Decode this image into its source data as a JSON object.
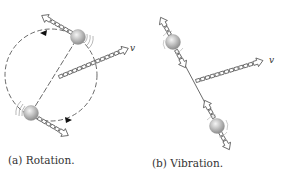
{
  "figures": [
    {
      "id": "a",
      "caption": "(a)  Rotation.",
      "velocity_label": "v",
      "description": "Two-ball molecule rotating about its center along a dashed circular path"
    },
    {
      "id": "b",
      "caption": "(b)  Vibration.",
      "velocity_label": "v",
      "description": "Two-ball molecule vibrating along its axis"
    }
  ],
  "colors": {
    "ball_fill": "#b8b8b8",
    "ball_highlight": "#f2f2f2",
    "line": "#444444",
    "arrow_fill": "#ffffff",
    "text": "#333333"
  }
}
